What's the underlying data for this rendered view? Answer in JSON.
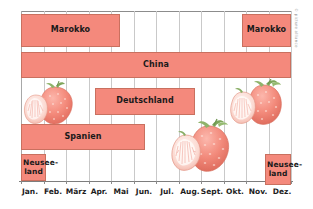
{
  "chart_data": {
    "type": "bar",
    "orientation": "horizontal-timeline",
    "title": "",
    "xlabel": "",
    "ylabel": "",
    "grid": true,
    "legend_position": "none",
    "categories": [
      "Jan.",
      "Feb.",
      "März",
      "Apr.",
      "Mai",
      "Jun.",
      "Jul.",
      "Aug.",
      "Sept.",
      "Okt.",
      "Nov.",
      "Dez."
    ],
    "axis_range": [
      "Jan.",
      "Dez."
    ],
    "rows": [
      {
        "label": "Marokko",
        "label_lines": [
          "Marokko"
        ],
        "start_month": 1,
        "end_month": 5,
        "start_label": "Jan.",
        "end_label": "Mai",
        "row_index": 0
      },
      {
        "label": "China",
        "label_lines": [
          "China"
        ],
        "start_month": 1,
        "end_month": 12,
        "start_label": "Jan.",
        "end_label": "Dez.",
        "row_index": 1
      },
      {
        "label": "Deutschland",
        "label_lines": [
          "Deutschland"
        ],
        "start_month": 4,
        "end_month": 8,
        "start_label": "Apr.",
        "end_label": "Aug.",
        "row_index": 2
      },
      {
        "label": "Spanien",
        "label_lines": [
          "Spanien"
        ],
        "start_month": 1,
        "end_month": 6.5,
        "start_label": "Jan.",
        "end_label": "Jun.",
        "row_index": 3
      },
      {
        "label": "Neuseeland",
        "label_lines": [
          "Neusee-",
          "land"
        ],
        "start_month": 1,
        "end_month": 2,
        "start_label": "Jan.",
        "end_label": "Feb.",
        "row_index": 4
      },
      {
        "label": "Marokko",
        "label_lines": [
          "Marokko"
        ],
        "start_month": 10.8,
        "end_month": 12,
        "start_label": "Nov.",
        "end_label": "Dez.",
        "row_index": 0
      },
      {
        "label": "Neuseeland",
        "label_lines": [
          "Neusee-",
          "land"
        ],
        "start_month": 11.8,
        "end_month": 12,
        "start_label": "Nov.",
        "end_label": "Dez.",
        "row_index": 4
      }
    ],
    "colors": {
      "bar_fill": "#F4897C",
      "bar_border": "#C9705F",
      "gridline": "#C9C9C9",
      "axis": "#7D7D7D",
      "label_text": "#1A1A1A",
      "background": "#FFFFFF"
    }
  },
  "bars": [
    {
      "name": "bar-marokko-early",
      "label": "Marokko",
      "lines": [
        "Marokko"
      ],
      "x": 21,
      "y": 14,
      "w": 99,
      "h": 33
    },
    {
      "name": "bar-china",
      "label": "China",
      "lines": [
        "China"
      ],
      "x": 21,
      "y": 52,
      "w": 270,
      "h": 26
    },
    {
      "name": "bar-deutschland",
      "label": "Deutschland",
      "lines": [
        "Deutschland"
      ],
      "x": 95,
      "y": 88,
      "w": 100,
      "h": 27
    },
    {
      "name": "bar-spanien",
      "label": "Spanien",
      "lines": [
        "Spanien"
      ],
      "x": 21,
      "y": 124,
      "w": 124,
      "h": 26
    },
    {
      "name": "bar-neuseeland-early",
      "label": "Neuseeland",
      "lines": [
        "Neusee-",
        "land"
      ],
      "x": 21,
      "y": 154,
      "w": 25,
      "h": 27
    },
    {
      "name": "bar-marokko-late",
      "label": "Marokko",
      "lines": [
        "Marokko"
      ],
      "x": 242,
      "y": 14,
      "w": 49,
      "h": 33
    },
    {
      "name": "bar-neuseeland-late",
      "label": "Neuseeland",
      "lines": [
        "Neusee-",
        "land"
      ],
      "x": 265,
      "y": 154,
      "w": 26,
      "h": 31
    }
  ],
  "gridlines_x": [
    21,
    43.5,
    66,
    88.5,
    111,
    133.5,
    156,
    178.5,
    201,
    223.5,
    246,
    268.5,
    291
  ],
  "month_label_positions": [
    {
      "label": "Jan.",
      "x": 30
    },
    {
      "label": "Feb.",
      "x": 53
    },
    {
      "label": "März",
      "x": 76
    },
    {
      "label": "Apr.",
      "x": 99
    },
    {
      "label": "Mai",
      "x": 121
    },
    {
      "label": "Jun.",
      "x": 144
    },
    {
      "label": "Jul.",
      "x": 167
    },
    {
      "label": "Aug.",
      "x": 190
    },
    {
      "label": "Sept.",
      "x": 212
    },
    {
      "label": "Okt.",
      "x": 235
    },
    {
      "label": "Nov.",
      "x": 258
    },
    {
      "label": "Dez.",
      "x": 282
    }
  ],
  "decorations": [
    {
      "name": "strawberry-photo-left",
      "x": 22,
      "y": 80,
      "w": 54,
      "h": 46
    },
    {
      "name": "strawberry-photo-center",
      "x": 168,
      "y": 118,
      "w": 66,
      "h": 58
    },
    {
      "name": "strawberry-photo-upper-right",
      "x": 228,
      "y": 79,
      "w": 56,
      "h": 48
    }
  ],
  "credit": {
    "text": "© picture alliance"
  }
}
